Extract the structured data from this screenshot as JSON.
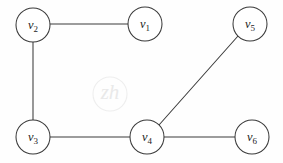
{
  "figure": {
    "background_color": "#fefefe",
    "stroke_color": "#3a3a3a",
    "label_color": "#1d1d1d",
    "width": 283,
    "height": 163
  },
  "watermark": {
    "text": "zh",
    "color": "#e9e9e9",
    "cx": 110,
    "cy": 94,
    "r": 17
  },
  "graph_data": {
    "type": "graph",
    "directed": false,
    "vertex_radius": 17,
    "vertices": [
      {
        "id": "v1",
        "letter": "v",
        "subscript": "1",
        "label": "v1",
        "cx": 145,
        "cy": 24
      },
      {
        "id": "v2",
        "letter": "v",
        "subscript": "2",
        "label": "v2",
        "cx": 33,
        "cy": 25
      },
      {
        "id": "v3",
        "letter": "v",
        "subscript": "3",
        "label": "v3",
        "cx": 33,
        "cy": 137
      },
      {
        "id": "v4",
        "letter": "v",
        "subscript": "4",
        "label": "v4",
        "cx": 147,
        "cy": 137
      },
      {
        "id": "v5",
        "letter": "v",
        "subscript": "5",
        "label": "v5",
        "cx": 250,
        "cy": 24
      },
      {
        "id": "v6",
        "letter": "v",
        "subscript": "6",
        "label": "v6",
        "cx": 252,
        "cy": 137
      }
    ],
    "edges": [
      {
        "id": "e-v2-v1",
        "from": "v2",
        "to": "v1",
        "x1": 50,
        "y1": 24,
        "x2": 128,
        "y2": 24
      },
      {
        "id": "e-v2-v3",
        "from": "v2",
        "to": "v3",
        "x1": 33,
        "y1": 42,
        "x2": 33,
        "y2": 120
      },
      {
        "id": "e-v3-v4",
        "from": "v3",
        "to": "v4",
        "x1": 50,
        "y1": 137,
        "x2": 130,
        "y2": 137
      },
      {
        "id": "e-v4-v6",
        "from": "v4",
        "to": "v6",
        "x1": 164,
        "y1": 137,
        "x2": 235,
        "y2": 137
      },
      {
        "id": "e-v4-v5",
        "from": "v4",
        "to": "v5",
        "x1": 159,
        "y1": 125,
        "x2": 238,
        "y2": 36
      }
    ]
  }
}
